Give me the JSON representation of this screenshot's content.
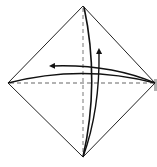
{
  "diagram": {
    "title": "",
    "type": "origami-fold-diagram",
    "colors": {
      "background": "#ffffff",
      "outline": "#222222",
      "crease": "#999999",
      "arrow": "#111111",
      "shadow": "#b0b0b0"
    },
    "shape": {
      "top": [
        83,
        6
      ],
      "right": [
        155,
        83
      ],
      "bottom": [
        83,
        157
      ],
      "left": [
        8,
        83
      ]
    },
    "creases": [
      {
        "name": "vertical-crease",
        "from": [
          83,
          6
        ],
        "to": [
          83,
          157
        ],
        "style": "dashed"
      },
      {
        "name": "horizontal-crease",
        "from": [
          8,
          83
        ],
        "to": [
          155,
          83
        ],
        "style": "dashed"
      }
    ],
    "arrows": [
      {
        "name": "fold-right-to-left-arrow",
        "direction": "left"
      },
      {
        "name": "fold-bottom-to-top-arrow",
        "direction": "up"
      }
    ]
  }
}
